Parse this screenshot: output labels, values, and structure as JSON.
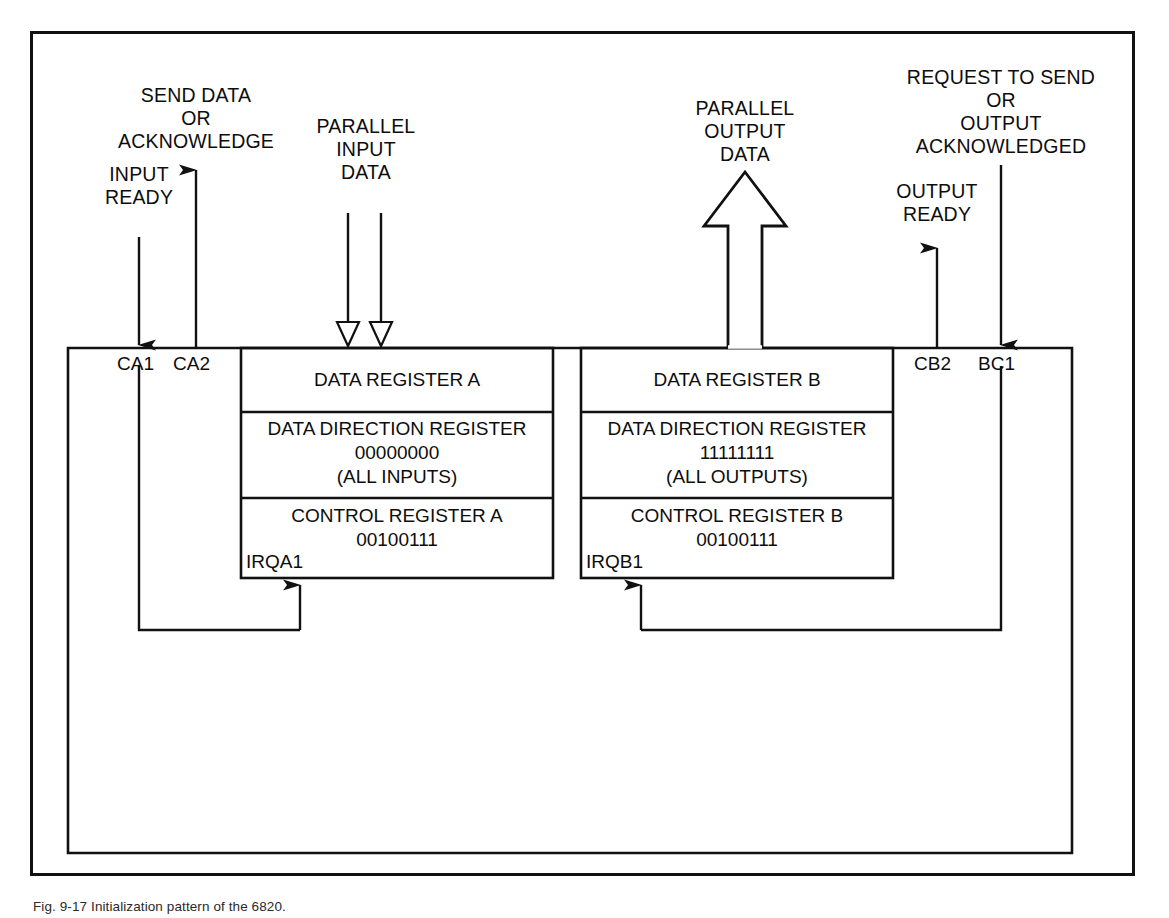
{
  "figure": {
    "caption": "Fig. 9-17  Initialization pattern of the 6820."
  },
  "signals": {
    "input_ready": "INPUT\nREADY",
    "send_data_or_acknowledge": "SEND DATA\nOR\nACKNOWLEDGE",
    "parallel_input_data": "PARALLEL\nINPUT\nDATA",
    "parallel_output_data": "PARALLEL\nOUTPUT\nDATA",
    "request_to_send_or_output_acknowledged": "REQUEST TO SEND\nOR\nOUTPUT\nACKNOWLEDGED",
    "output_ready": "OUTPUT\nREADY"
  },
  "pins": {
    "ca1": "CA1",
    "ca2": "CA2",
    "cb2": "CB2",
    "bc1": "BC1",
    "irqa1": "IRQA1",
    "irqb1": "IRQB1"
  },
  "side_a": {
    "data_register": "DATA REGISTER A",
    "ddr_title": "DATA DIRECTION REGISTER",
    "ddr_value": "00000000",
    "ddr_note": "(ALL INPUTS)",
    "control_title": "CONTROL REGISTER A",
    "control_value": "00100111"
  },
  "side_b": {
    "data_register": "DATA REGISTER B",
    "ddr_title": "DATA DIRECTION REGISTER",
    "ddr_value": "11111111",
    "ddr_note": "(ALL OUTPUTS)",
    "control_title": "CONTROL REGISTER B",
    "control_value": "00100111"
  },
  "colors": {
    "line": "#111111",
    "text": "#0d0d0d",
    "background": "#ffffff"
  },
  "icons": {
    "arrow_down_filled": "arrow-down-filled-icon",
    "arrow_up_filled": "arrow-up-filled-icon",
    "arrow_down_hollow": "arrow-down-hollow-icon",
    "arrow_up_hollow_block": "arrow-up-hollow-block-icon"
  }
}
